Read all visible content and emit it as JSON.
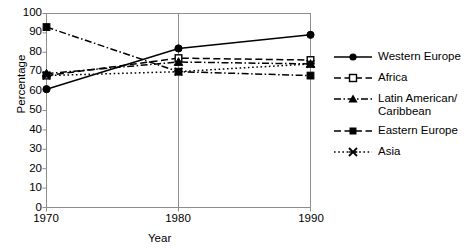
{
  "chart_data": {
    "type": "line",
    "title": "",
    "xlabel": "Year",
    "ylabel": "Percentage",
    "categories": [
      "1970",
      "1980",
      "1990"
    ],
    "x": [
      1970,
      1980,
      1990
    ],
    "xlim": [
      1970,
      1990
    ],
    "ylim": [
      0,
      100
    ],
    "yticks": [
      "0",
      "10",
      "20",
      "30",
      "40",
      "50",
      "60",
      "70",
      "80",
      "90",
      "100"
    ],
    "ytick_values": [
      0,
      10,
      20,
      30,
      40,
      50,
      60,
      70,
      80,
      90,
      100
    ],
    "grid": false,
    "legend_position": "right",
    "series": [
      {
        "name": "Western Europe",
        "values": [
          61,
          82,
          89
        ],
        "marker": "filled-circle",
        "line_style": "solid",
        "color": "#000000"
      },
      {
        "name": "Africa",
        "values": [
          68,
          77,
          76
        ],
        "marker": "open-square",
        "line_style": "dashed",
        "color": "#000000"
      },
      {
        "name": "Latin American/\nCaribbean",
        "values": [
          69,
          75,
          74
        ],
        "marker": "filled-triangle",
        "line_style": "dash-dot",
        "color": "#000000"
      },
      {
        "name": "Eastern Europe",
        "values": [
          93,
          70,
          68
        ],
        "marker": "filled-square",
        "line_style": "dash-dot",
        "color": "#000000"
      },
      {
        "name": "Asia",
        "values": [
          68,
          70,
          74
        ],
        "marker": "x-cross",
        "line_style": "dotted",
        "color": "#000000"
      }
    ]
  },
  "axis": {
    "y_label": "Percentage",
    "x_label": "Year",
    "y_ticks": [
      "100",
      "90",
      "80",
      "70",
      "60",
      "50",
      "40",
      "30",
      "20",
      "10",
      "0"
    ],
    "x_ticks": [
      "1970",
      "1980",
      "1990"
    ]
  },
  "legend": {
    "items": [
      {
        "label": "Western Europe"
      },
      {
        "label": "Africa"
      },
      {
        "label": "Latin American/\nCaribbean"
      },
      {
        "label": "Eastern Europe"
      },
      {
        "label": "Asia"
      }
    ]
  },
  "colors": {
    "ink": "#000000",
    "frame": "#8d8d8d",
    "background": "#ffffff"
  }
}
